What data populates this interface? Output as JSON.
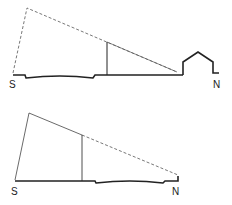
{
  "diagrams": [
    {
      "id": "top",
      "labels": {
        "south": "S",
        "north": "N"
      },
      "description": "Tall south wall with dashed sun-angle line reaching house on north side"
    },
    {
      "id": "bottom",
      "labels": {
        "south": "S",
        "north": "N"
      },
      "description": "Lower sloped profile with solid then dashed sun-angle line toward north"
    }
  ],
  "colors": {
    "line": "#222222",
    "background": "#ffffff"
  }
}
